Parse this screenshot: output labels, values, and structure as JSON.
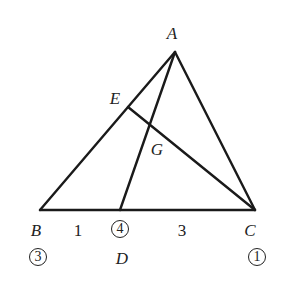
{
  "diagram": {
    "stroke_color": "#1a1a1a",
    "points": {
      "A": {
        "label": "A",
        "x": 175,
        "y": 52,
        "label_x": 172,
        "label_y": 33
      },
      "B": {
        "label": "B",
        "x": 40,
        "y": 210,
        "label_x": 36,
        "label_y": 230
      },
      "C": {
        "label": "C",
        "x": 255,
        "y": 210,
        "label_x": 250,
        "label_y": 230
      },
      "D": {
        "label": "D",
        "x": 120,
        "y": 210,
        "label_x": 122,
        "label_y": 258
      },
      "E": {
        "label": "E",
        "x": 128,
        "y": 107,
        "label_x": 115,
        "label_y": 98
      },
      "G": {
        "label": "G",
        "x": 151,
        "y": 124,
        "label_x": 157,
        "label_y": 149
      }
    },
    "segments": [
      {
        "from": "A",
        "to": "B"
      },
      {
        "from": "A",
        "to": "C"
      },
      {
        "from": "B",
        "to": "C"
      },
      {
        "from": "A",
        "to": "D"
      },
      {
        "from": "E",
        "to": "C"
      }
    ],
    "segment_labels": [
      {
        "text": "1",
        "x": 78,
        "y": 230,
        "segment": "BD"
      },
      {
        "text": "3",
        "x": 182,
        "y": 230,
        "segment": "DC"
      }
    ],
    "mass_labels": [
      {
        "text": "3",
        "point": "B",
        "x": 38,
        "y": 257
      },
      {
        "text": "4",
        "point": "D",
        "x": 120,
        "y": 229
      },
      {
        "text": "1",
        "point": "C",
        "x": 257,
        "y": 257
      }
    ]
  }
}
